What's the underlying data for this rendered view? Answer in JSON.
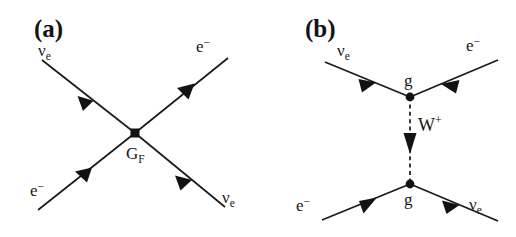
{
  "figure": {
    "caption_present": false,
    "background_color": "#ffffff",
    "ink_color": "#161616",
    "width": 516,
    "height": 237
  },
  "panels": [
    {
      "id": "a",
      "label": "(a)",
      "type": "four-fermion-contact-interaction",
      "vertex": {
        "label_base": "G",
        "label_sub": "F",
        "marker": "square",
        "x": 135,
        "y": 133
      },
      "legs": [
        {
          "name": "incoming-neutrino-upper-left",
          "particle_base": "ν",
          "particle_sub": "e",
          "particle_sup": "",
          "corner": "upper-left",
          "arrow_direction": "toward-vertex"
        },
        {
          "name": "incoming-electron-lower-left",
          "particle_base": "e",
          "particle_sub": "",
          "particle_sup": "−",
          "corner": "lower-left",
          "arrow_direction": "toward-vertex"
        },
        {
          "name": "outgoing-electron-upper-right",
          "particle_base": "e",
          "particle_sub": "",
          "particle_sup": "−",
          "corner": "upper-right",
          "arrow_direction": "away-from-vertex"
        },
        {
          "name": "outgoing-neutrino-lower-right",
          "particle_base": "ν",
          "particle_sub": "e",
          "particle_sup": "",
          "corner": "lower-right",
          "arrow_direction": "away-from-vertex"
        }
      ]
    },
    {
      "id": "b",
      "label": "(b)",
      "type": "w-boson-exchange",
      "propagator": {
        "name": "w-boson-propagator",
        "label_base": "W",
        "label_sup": "+",
        "style": "dashed",
        "arrow_direction": "downward"
      },
      "vertices": [
        {
          "name": "upper-vertex",
          "label": "g",
          "marker": "round",
          "x": 410,
          "y": 97
        },
        {
          "name": "lower-vertex",
          "label": "g",
          "marker": "round",
          "x": 410,
          "y": 184
        }
      ],
      "legs": [
        {
          "name": "incoming-neutrino-upper-left",
          "particle_base": "ν",
          "particle_sub": "e",
          "particle_sup": "",
          "corner": "upper-left",
          "arrow_direction": "toward-vertex"
        },
        {
          "name": "outgoing-electron-upper-right",
          "particle_base": "e",
          "particle_sub": "",
          "particle_sup": "−",
          "corner": "upper-right",
          "arrow_direction": "toward-vertex"
        },
        {
          "name": "incoming-electron-lower-left",
          "particle_base": "e",
          "particle_sub": "",
          "particle_sup": "−",
          "corner": "lower-left",
          "arrow_direction": "toward-vertex"
        },
        {
          "name": "outgoing-neutrino-lower-right",
          "particle_base": "ν",
          "particle_sub": "e",
          "particle_sup": "",
          "corner": "lower-right",
          "arrow_direction": "away-from-vertex"
        }
      ]
    }
  ]
}
